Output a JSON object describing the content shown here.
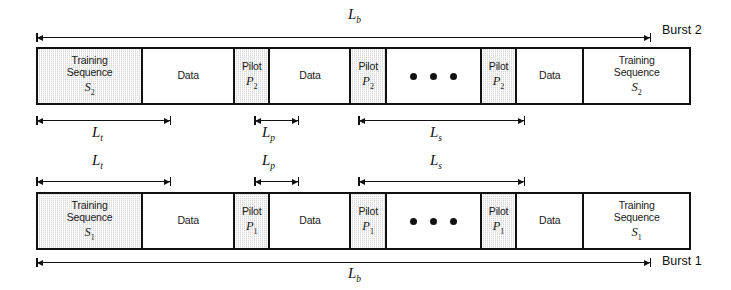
{
  "figure": {
    "type": "frame-structure-diagram"
  },
  "bursts": [
    {
      "id": "burst-2",
      "label": "Burst 2",
      "position": "top",
      "blocks": [
        {
          "kind": "training",
          "line1": "Training",
          "line2": "Sequence",
          "symbol": "S",
          "subscript": "2",
          "shaded": true
        },
        {
          "kind": "data",
          "line1": "Data",
          "shaded": false
        },
        {
          "kind": "pilot",
          "line1": "Pilot",
          "symbol": "P",
          "subscript": "2",
          "shaded": true
        },
        {
          "kind": "data",
          "line1": "Data",
          "shaded": false
        },
        {
          "kind": "pilot",
          "line1": "Pilot",
          "symbol": "P",
          "subscript": "2",
          "shaded": true
        },
        {
          "kind": "ellipsis",
          "line1": "",
          "shaded": false
        },
        {
          "kind": "pilot",
          "line1": "Pilot",
          "symbol": "P",
          "subscript": "2",
          "shaded": true
        },
        {
          "kind": "data",
          "line1": "Data",
          "shaded": false
        },
        {
          "kind": "training",
          "line1": "Training",
          "line2": "Sequence",
          "symbol": "S",
          "subscript": "2",
          "shaded": false
        }
      ],
      "dimensions": [
        {
          "name": "burst-length",
          "symbol": "L",
          "subscript": "b",
          "placement": "above"
        },
        {
          "name": "training-length",
          "symbol": "L",
          "subscript": "t",
          "placement": "below"
        },
        {
          "name": "pilot-length",
          "symbol": "L",
          "subscript": "p",
          "placement": "below"
        },
        {
          "name": "slot-length",
          "symbol": "L",
          "subscript": "s",
          "placement": "below"
        }
      ]
    },
    {
      "id": "burst-1",
      "label": "Burst 1",
      "position": "bottom",
      "blocks": [
        {
          "kind": "training",
          "line1": "Training",
          "line2": "Sequence",
          "symbol": "S",
          "subscript": "1",
          "shaded": true
        },
        {
          "kind": "data",
          "line1": "Data",
          "shaded": false
        },
        {
          "kind": "pilot",
          "line1": "Pilot",
          "symbol": "P",
          "subscript": "1",
          "shaded": true
        },
        {
          "kind": "data",
          "line1": "Data",
          "shaded": false
        },
        {
          "kind": "pilot",
          "line1": "Pilot",
          "symbol": "P",
          "subscript": "1",
          "shaded": true
        },
        {
          "kind": "ellipsis",
          "line1": "",
          "shaded": false
        },
        {
          "kind": "pilot",
          "line1": "Pilot",
          "symbol": "P",
          "subscript": "1",
          "shaded": true
        },
        {
          "kind": "data",
          "line1": "Data",
          "shaded": false
        },
        {
          "kind": "training",
          "line1": "Training",
          "line2": "Sequence",
          "symbol": "S",
          "subscript": "1",
          "shaded": false
        }
      ],
      "dimensions": [
        {
          "name": "training-length",
          "symbol": "L",
          "subscript": "t",
          "placement": "above"
        },
        {
          "name": "pilot-length",
          "symbol": "L",
          "subscript": "p",
          "placement": "above"
        },
        {
          "name": "slot-length",
          "symbol": "L",
          "subscript": "s",
          "placement": "above"
        },
        {
          "name": "burst-length",
          "symbol": "L",
          "subscript": "b",
          "placement": "below"
        }
      ]
    }
  ],
  "labels": {
    "training_line1": "Training",
    "training_line2": "Sequence",
    "data": "Data",
    "pilot": "Pilot",
    "burst2": "Burst 2",
    "burst1": "Burst 1",
    "L": "L",
    "sub_b": "b",
    "sub_t": "t",
    "sub_p": "p",
    "sub_s": "s",
    "S": "S",
    "P": "P",
    "sub_1": "1",
    "sub_2": "2"
  },
  "colors": {
    "stroke": "#111111",
    "shaded_fill": "#d9d9d9",
    "background": "#ffffff"
  }
}
